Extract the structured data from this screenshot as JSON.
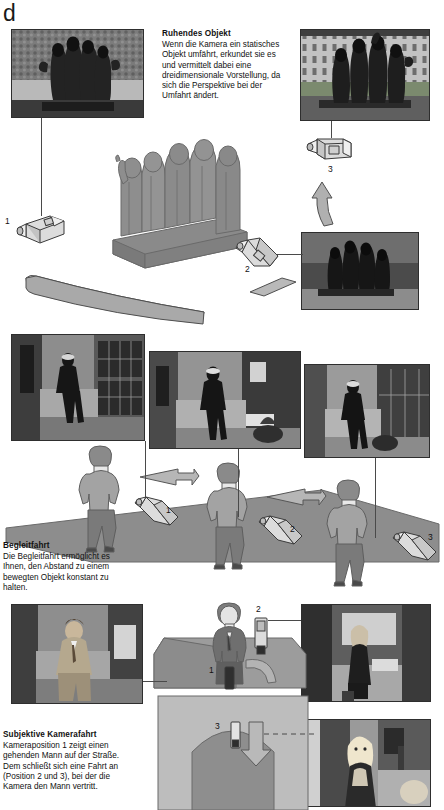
{
  "page": {
    "corner_letter": "d",
    "background": "#ffffff"
  },
  "sections": [
    {
      "id": "ruhendes-objekt",
      "heading": "Ruhendes Objekt",
      "body": "Wenn die Kamera ein statisches Objekt umfährt, erkundet sie es und vermittelt dabei eine dreidimensionale Vorstellung, da sich die Perspektive bei der Umfahrt ändert.",
      "camera_labels": [
        "1",
        "2",
        "3"
      ]
    },
    {
      "id": "begleitfahrt",
      "heading": "Begleitfahrt",
      "body": "Die Begleitfahrt ermöglicht es Ihnen, den Abstand zu einem bewegten Objekt konstant zu halten.",
      "camera_labels": [
        "1",
        "2",
        "3"
      ]
    },
    {
      "id": "subjektive-kamerafahrt",
      "heading": "Subjektive Kamerafahrt",
      "body": "Kameraposition 1 zeigt einen gehenden Mann auf der Straße. Dem schließt sich eine Fahrt an (Position 2 und 3), bei der die Kamera den Mann vertritt.",
      "position_labels": [
        "1",
        "2",
        "3"
      ]
    }
  ],
  "photos": {
    "sculpture_left": "statue-front-view-photo",
    "sculpture_right": "statue-side-view-photo",
    "sculpture_mid": "statue-rear-view-photo",
    "alley_1": "walking-man-alley-photo-1",
    "alley_2": "walking-man-alley-photo-2",
    "alley_3": "walking-man-alley-photo-3",
    "man_suit": "man-in-suit-street-photo",
    "shop_window": "woman-shop-window-photo",
    "woman_street": "blonde-woman-street-photo"
  },
  "colors": {
    "figure_fill": "#9a9a9a",
    "figure_dark": "#7d7d7d",
    "ground": "#8f8f8f",
    "arrow_fill": "#b4b4b4",
    "camera_fill": "#d6d6d6",
    "outline": "#3b3b3b",
    "text": "#111111"
  },
  "labels": {
    "cam_top_1": "1",
    "cam_top_2": "2",
    "cam_top_3": "3",
    "cam_mid_1": "1",
    "cam_mid_2": "2",
    "cam_mid_3": "3",
    "pos_bottom_1": "1",
    "pos_bottom_2": "2",
    "pos_bottom_3": "3"
  }
}
